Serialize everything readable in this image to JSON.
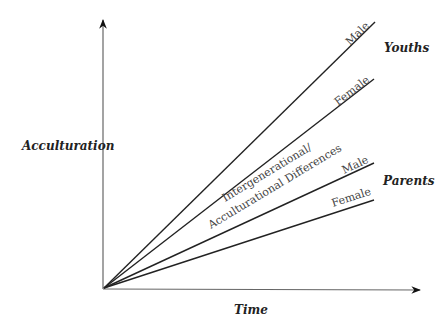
{
  "diagram": {
    "y_axis_label": "Acculturation",
    "x_axis_label": "Time",
    "groups": [
      {
        "name": "Youths",
        "lines": [
          {
            "label": "Male",
            "end": [
              375,
              22
            ]
          },
          {
            "label": "Female",
            "end": [
              374,
              79
            ]
          }
        ]
      },
      {
        "name": "Parents",
        "lines": [
          {
            "label": "Male",
            "end": [
              374,
              163
            ]
          },
          {
            "label": "Female",
            "end": [
              374,
              200
            ]
          }
        ]
      }
    ],
    "gap_label_line1": "Intergenerational/",
    "gap_label_line2": "Acculturational Differences"
  },
  "colors": {
    "axis": "#555555",
    "line": "#222222",
    "text": "#333333"
  }
}
